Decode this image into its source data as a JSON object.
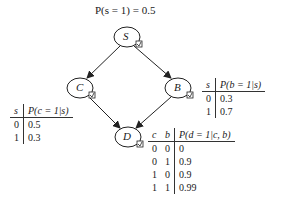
{
  "prior": "P(s = 1) = 0.5",
  "nodes": [
    {
      "id": "S",
      "label": "S",
      "cx": 127,
      "cy": 37
    },
    {
      "id": "C",
      "label": "C",
      "cx": 80,
      "cy": 88
    },
    {
      "id": "B",
      "label": "B",
      "cx": 178,
      "cy": 88
    },
    {
      "id": "D",
      "label": "D",
      "cx": 128,
      "cy": 137
    }
  ],
  "edges": [
    [
      "S",
      "C"
    ],
    [
      "S",
      "B"
    ],
    [
      "C",
      "D"
    ],
    [
      "B",
      "D"
    ]
  ],
  "cpt_c": {
    "headers": [
      "s",
      "P(c = 1|s)"
    ],
    "rows": [
      [
        "0",
        "0.5"
      ],
      [
        "1",
        "0.3"
      ]
    ]
  },
  "cpt_b": {
    "headers": [
      "s",
      "P(b = 1|s)"
    ],
    "rows": [
      [
        "0",
        "0.3"
      ],
      [
        "1",
        "0.7"
      ]
    ]
  },
  "cpt_d": {
    "headers": [
      "c",
      "b",
      "P(d = 1|c, b)"
    ],
    "rows": [
      [
        "0",
        "0",
        "0"
      ],
      [
        "0",
        "1",
        "0.9"
      ],
      [
        "1",
        "0",
        "0.9"
      ],
      [
        "1",
        "1",
        "0.99"
      ]
    ]
  }
}
